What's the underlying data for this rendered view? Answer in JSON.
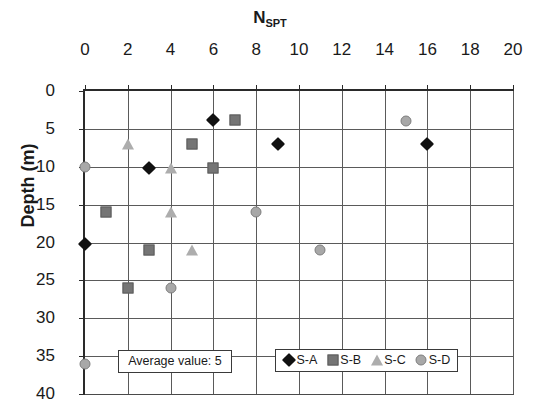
{
  "chart_data": {
    "type": "scatter",
    "title_main": "N",
    "title_sub": "SPT",
    "xlabel": "",
    "ylabel": "Depth (m)",
    "xlim": [
      0,
      20
    ],
    "ylim": [
      0,
      40
    ],
    "y_inverted": true,
    "x_ticks": [
      0,
      2,
      4,
      6,
      8,
      10,
      12,
      14,
      16,
      18,
      20
    ],
    "y_ticks": [
      0,
      5,
      10,
      15,
      20,
      25,
      30,
      35,
      40
    ],
    "x_tick_labels": [
      "0",
      "2",
      "4",
      "6",
      "8",
      "10",
      "12",
      "14",
      "16",
      "18",
      "20"
    ],
    "y_tick_labels": [
      "0",
      "5",
      "10",
      "15",
      "20",
      "25",
      "30",
      "35",
      "40"
    ],
    "grid": true,
    "x_axis_position": "top",
    "legend_position": "bottom-center",
    "annotation": "Average value: 5",
    "series": [
      {
        "name": "S-A",
        "marker": "diamond",
        "color": "#111111",
        "points": [
          {
            "x": 6,
            "y": 3.8
          },
          {
            "x": 9,
            "y": 7.0
          },
          {
            "x": 3,
            "y": 10.2
          },
          {
            "x": 0,
            "y": 20.2
          },
          {
            "x": 16,
            "y": 7.0
          }
        ]
      },
      {
        "name": "S-B",
        "marker": "square",
        "color": "#757575",
        "points": [
          {
            "x": 7,
            "y": 3.8
          },
          {
            "x": 5,
            "y": 7.0
          },
          {
            "x": 6,
            "y": 10.2
          },
          {
            "x": 1,
            "y": 16.0
          },
          {
            "x": 3,
            "y": 21.0
          },
          {
            "x": 2,
            "y": 26.0
          }
        ]
      },
      {
        "name": "S-C",
        "marker": "triangle",
        "color": "#adadad",
        "points": [
          {
            "x": 2,
            "y": 7.0
          },
          {
            "x": 4,
            "y": 10.2
          },
          {
            "x": 4,
            "y": 16.0
          },
          {
            "x": 5,
            "y": 21.0
          }
        ]
      },
      {
        "name": "S-D",
        "marker": "circle",
        "color": "#a8a8a8",
        "points": [
          {
            "x": 15,
            "y": 4.0
          },
          {
            "x": 0,
            "y": 10.0
          },
          {
            "x": 8,
            "y": 16.0
          },
          {
            "x": 11,
            "y": 21.0
          },
          {
            "x": 4,
            "y": 26.0
          },
          {
            "x": 0,
            "y": 36.0
          }
        ]
      }
    ]
  },
  "legend": {
    "entries": [
      {
        "label": "S-A",
        "marker": "diamond"
      },
      {
        "label": "S-B",
        "marker": "square"
      },
      {
        "label": "S-C",
        "marker": "triangle"
      },
      {
        "label": "S-D",
        "marker": "circle"
      }
    ]
  },
  "colors": {
    "axis": "#2a2a2a",
    "grid": "#5a5a5a",
    "s_a": "#111111",
    "s_b": "#757575",
    "s_c": "#adadad",
    "s_d": "#a8a8a8",
    "background": "#ffffff"
  }
}
